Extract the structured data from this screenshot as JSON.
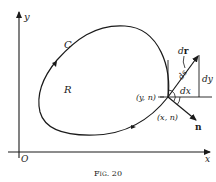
{
  "figure": {
    "caption": "Fig. 20",
    "axes": {
      "x_label": "x",
      "y_label": "y",
      "origin_label": "O"
    },
    "curve_label": "C",
    "region_label": "R",
    "labels": {
      "dr": "dr",
      "ds": "ds",
      "dx": "dx",
      "dy": "dy",
      "angle_y_n": "(y, n)",
      "angle_x_n": "(x, n)",
      "normal": "n"
    },
    "colors": {
      "ink": "#1a1a1a",
      "background": "#ffffff"
    }
  }
}
